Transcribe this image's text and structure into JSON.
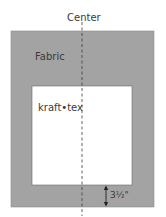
{
  "diagram": {
    "center_label": "Center",
    "outer_label": "Fabric",
    "inner_label": "kraft•tex",
    "dimension_label": "3½\"",
    "colors": {
      "fabric": "#a3a3a3",
      "kraft_tex": "#ffffff",
      "lines": "#3a3a3a"
    }
  }
}
